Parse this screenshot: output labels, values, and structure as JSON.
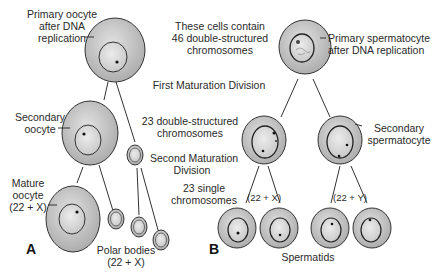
{
  "panels": {
    "a": {
      "letter": "A",
      "labels": {
        "primary_oocyte": [
          "Primary oocyte",
          "after DNA",
          "replication"
        ],
        "secondary_oocyte": [
          "Secondary",
          "oocyte"
        ],
        "mature_oocyte": [
          "Mature",
          "oocyte",
          "(22 + X)"
        ],
        "polar_bodies": [
          "Polar bodies",
          "(22 + X)"
        ]
      }
    },
    "b": {
      "letter": "B",
      "labels": {
        "primary_spermatocyte": [
          "Primary spermatocyte",
          "after DNA replication"
        ],
        "secondary_spermatocyte": [
          "Secondary",
          "spermatocyte"
        ],
        "left_pair": "(22 + X)",
        "right_pair": "(22 + Y)",
        "spermatids": "Spermatids"
      }
    }
  },
  "center_notes": {
    "cells_contain": [
      "These cells contain",
      "46 double-structured",
      "chromosomes"
    ],
    "first_division": "First Maturation Division",
    "double_structured": [
      "23 double-structured",
      "chromosomes"
    ],
    "second_division": [
      "Second Maturation",
      "Division"
    ],
    "single": [
      "23 single",
      "chromosomes"
    ]
  },
  "colors": {
    "cytoplasm": "#c9c9c9",
    "nucleus": "#dcdcdc",
    "outline": "#333333",
    "text": "#2a2a2a"
  }
}
